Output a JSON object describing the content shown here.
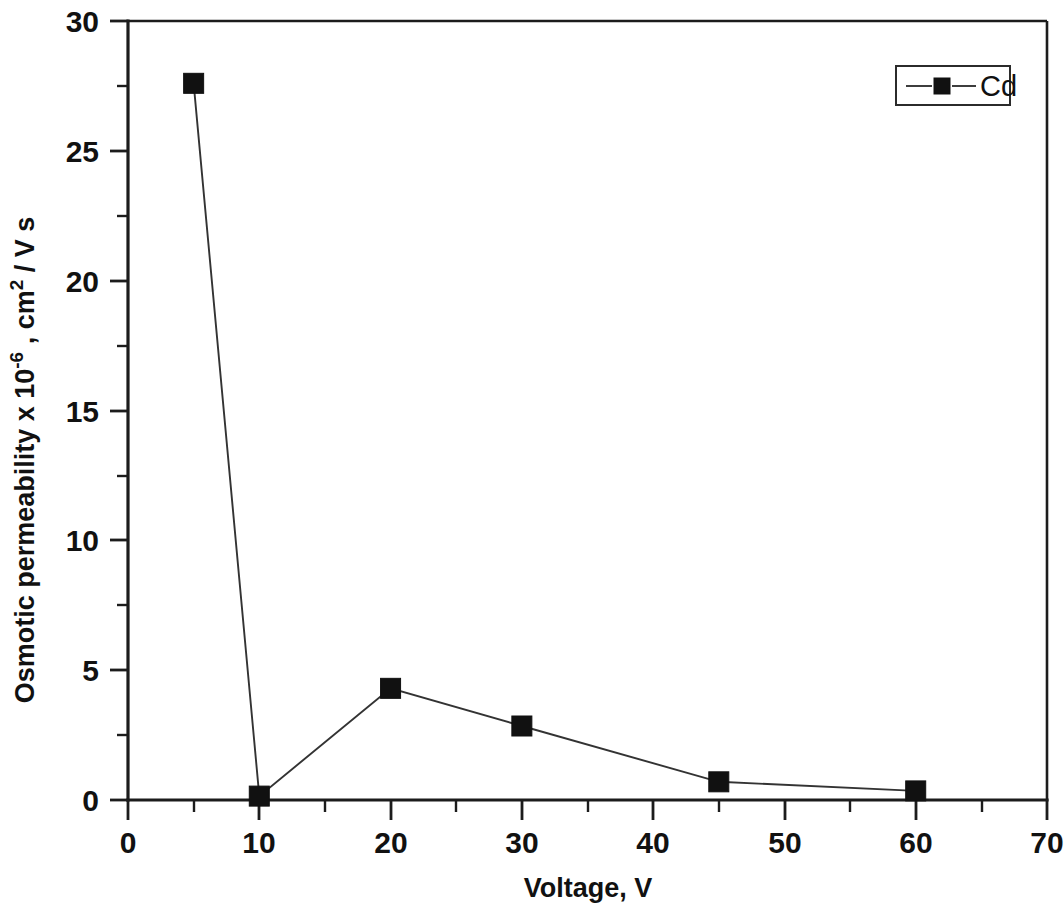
{
  "chart_data": {
    "type": "line",
    "title": "",
    "xlabel": "Voltage, V",
    "ylabel_parts": {
      "main": "Osmotic permeability x 10",
      "exp": "-6",
      "tail": " , cm",
      "exp2": "2",
      "tail2": " / V s"
    },
    "ylabel": "Osmotic permeability x 10-6 , cm2 / V s",
    "xlim": [
      0,
      70
    ],
    "ylim": [
      0,
      30
    ],
    "x_major_ticks": [
      0,
      10,
      20,
      30,
      40,
      50,
      60,
      70
    ],
    "x_minor_ticks": [
      5,
      15,
      25,
      35,
      45,
      55,
      65
    ],
    "y_major_ticks": [
      0,
      5,
      10,
      15,
      20,
      25,
      30
    ],
    "y_minor_ticks": [
      2.5,
      7.5,
      12.5,
      17.5,
      22.5,
      27.5
    ],
    "x_tick_labels": [
      "0",
      "10",
      "20",
      "30",
      "40",
      "50",
      "60",
      "70"
    ],
    "y_tick_labels": [
      "0",
      "5",
      "10",
      "15",
      "20",
      "25",
      "30"
    ],
    "grid": false,
    "legend_position": "top-right",
    "series": [
      {
        "name": "Cd",
        "marker": "filled-square",
        "color": "#111111",
        "x": [
          5,
          10,
          20,
          30,
          45,
          60
        ],
        "values": [
          27.6,
          0.15,
          4.3,
          2.85,
          0.7,
          0.35
        ]
      }
    ]
  },
  "legend": {
    "entries": [
      {
        "label": "Cd"
      }
    ]
  },
  "axes": {
    "x_title": "Voltage, V",
    "y_title": "Osmotic permeability x 10",
    "y_title_exp": "-6",
    "y_title_mid": " , cm",
    "y_title_exp2": "2",
    "y_title_end": " / V s"
  },
  "colors": {
    "axis": "#1c1c1c",
    "series": "#111111",
    "background": "#ffffff"
  }
}
